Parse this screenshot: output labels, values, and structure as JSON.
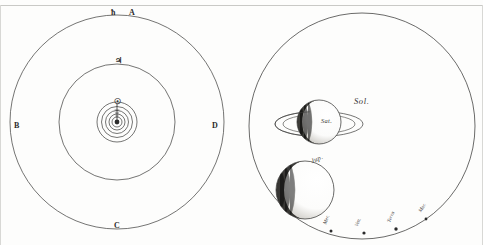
{
  "plate": {
    "title": "Comparative diagram of planetary orbits and planetary magnitudes",
    "background_color": "#fdfdfc",
    "ink_color": "#2b2b2b",
    "rule_color": "#c9c9c6"
  },
  "figure_left": {
    "name": "orbit-diagram",
    "description": "Concentric circular orbits with lettered reference points",
    "orbits": [
      {
        "id": "outer",
        "label": "A",
        "symbol": "ħ",
        "radius": 108
      },
      {
        "id": "middle",
        "label": "",
        "symbol": "♃",
        "radius": 58
      },
      {
        "id": "inner1",
        "label": "",
        "symbol": "",
        "radius": 20
      },
      {
        "id": "inner2",
        "label": "",
        "symbol": "",
        "radius": 15
      },
      {
        "id": "inner3",
        "label": "",
        "symbol": "",
        "radius": 11
      },
      {
        "id": "inner4",
        "label": "",
        "symbol": "",
        "radius": 7
      },
      {
        "id": "inner5",
        "label": "",
        "symbol": "",
        "radius": 4
      }
    ],
    "reference_points": [
      {
        "label": "A",
        "position": "top-right"
      },
      {
        "label": "B",
        "position": "left"
      },
      {
        "label": "C",
        "position": "bottom"
      },
      {
        "label": "D",
        "position": "right"
      }
    ],
    "symbols": [
      {
        "name": "saturn-symbol",
        "glyph": "ħ",
        "position": "top-outer"
      },
      {
        "name": "jupiter-symbol",
        "glyph": "♃",
        "position": "top-middle"
      },
      {
        "name": "center-symbol",
        "glyph": "☉",
        "position": "center"
      }
    ]
  },
  "figure_right": {
    "name": "planet-size-comparison",
    "description": "Great circle of the Sun with planets drawn to comparative scale",
    "sun": {
      "label": "Sol.",
      "name": "sol-label"
    },
    "bodies": [
      {
        "name": "saturn",
        "label": "Sat.",
        "has_ring": true
      },
      {
        "name": "jupiter",
        "label": "Jup.",
        "has_ring": false
      }
    ],
    "minor_bodies": [
      {
        "name": "mercury",
        "label": "Mer."
      },
      {
        "name": "venus",
        "label": "Ven."
      },
      {
        "name": "terra",
        "label": "Terra"
      },
      {
        "name": "mars",
        "label": "Mar."
      }
    ]
  }
}
